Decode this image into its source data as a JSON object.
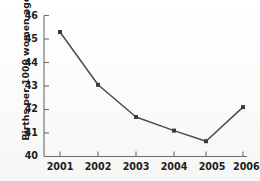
{
  "chart_data": {
    "type": "line",
    "title": "",
    "subtitle": "",
    "xlabel": "",
    "ylabel": "Births per 1000 women ages 15-19",
    "categories": [
      "2001",
      "2002",
      "2003",
      "2004",
      "2005",
      "2006"
    ],
    "x": [
      2001,
      2002,
      2003,
      2004,
      2005,
      2006
    ],
    "values": [
      45.3,
      43.05,
      41.68,
      41.1,
      40.65,
      42.1
    ],
    "series": [
      {
        "name": "Births per 1000 women ages 15-19",
        "values": [
          45.3,
          43.05,
          41.68,
          41.1,
          40.65,
          42.1
        ]
      }
    ],
    "ylim": [
      40,
      46
    ],
    "ytick_labels": [
      "40",
      "41",
      "42",
      "43",
      "44",
      "45",
      "46"
    ],
    "ytick_values": [
      40,
      41,
      42,
      43,
      44,
      45,
      46
    ],
    "xtick_labels": [
      "2001",
      "2002",
      "2003",
      "2004",
      "2005",
      "2006"
    ],
    "xtick_labels_rendered": [
      "2001",
      "2002",
      "2003",
      "2004",
      "2005",
      "2006"
    ],
    "last_xtick_clipped": true,
    "grid": false,
    "legend": false,
    "legend_position": "none",
    "marker": "square",
    "line_color": "#4a4a52",
    "marker_color": "#3a3a42",
    "axis_color": "#6b6b72",
    "text_color": "#1c1c1c",
    "background_color": "#fdfdfc"
  },
  "axis": {
    "y_axis_title": "Births per 1000 women ages 15-19"
  }
}
